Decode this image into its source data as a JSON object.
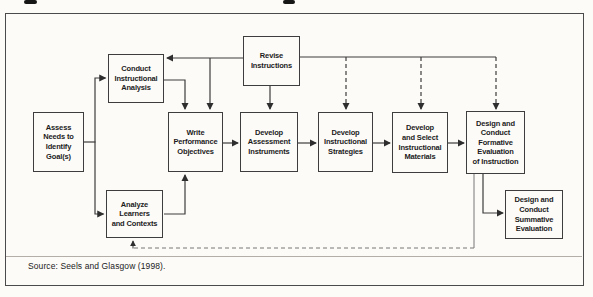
{
  "figure": {
    "source_note": "Source: Seels and Glasgow (1998).",
    "cropped_title_note": "title cropped at top edge; only descender fragments visible"
  },
  "diagram": {
    "type": "flowchart",
    "nodes": {
      "assess": {
        "label": "Assess\nNeeds to\nIdentify\nGoal(s)"
      },
      "conduct": {
        "label": "Conduct\nInstructional\nAnalysis"
      },
      "revise": {
        "label": "Revise\nInstructions"
      },
      "write": {
        "label": "Write\nPerformance\nObjectives"
      },
      "assessment": {
        "label": "Develop\nAssessment\nInstruments"
      },
      "strategies": {
        "label": "Develop\nInstructional\nStrategies"
      },
      "materials": {
        "label": "Develop\nand Select\nInstructional\nMaterials"
      },
      "formative": {
        "label": "Design and\nConduct\nFormative\nEvaluation\nof Instruction"
      },
      "analyze": {
        "label": "Analyze\nLearners\nand Contexts"
      },
      "summative": {
        "label": "Design and\nConduct\nSummative\nEvaluation"
      }
    },
    "edges": [
      {
        "from": "assess",
        "to": "conduct",
        "style": "solid"
      },
      {
        "from": "assess",
        "to": "analyze",
        "style": "solid"
      },
      {
        "from": "conduct",
        "to": "write",
        "style": "solid"
      },
      {
        "from": "analyze",
        "to": "write",
        "style": "solid"
      },
      {
        "from": "write",
        "to": "assessment",
        "style": "solid"
      },
      {
        "from": "assessment",
        "to": "strategies",
        "style": "solid"
      },
      {
        "from": "strategies",
        "to": "materials",
        "style": "solid"
      },
      {
        "from": "materials",
        "to": "formative",
        "style": "solid"
      },
      {
        "from": "formative",
        "to": "summative",
        "style": "solid"
      },
      {
        "from": "revise",
        "to": "conduct",
        "style": "solid"
      },
      {
        "from": "revise",
        "to": "write",
        "style": "solid"
      },
      {
        "from": "revise",
        "to": "assessment",
        "style": "solid"
      },
      {
        "from": "revise",
        "to": "strategies",
        "style": "dashed"
      },
      {
        "from": "revise",
        "to": "materials",
        "style": "dashed"
      },
      {
        "from": "revise",
        "to": "formative",
        "style": "dashed"
      },
      {
        "from": "formative",
        "to": "analyze",
        "style": "dashed"
      }
    ],
    "colors": {
      "line": "#3c3c3c",
      "feedback_line": "#767676",
      "box_border": "#3d3d3d",
      "text": "#1c1c1c",
      "background": "#fcfbf8"
    }
  }
}
